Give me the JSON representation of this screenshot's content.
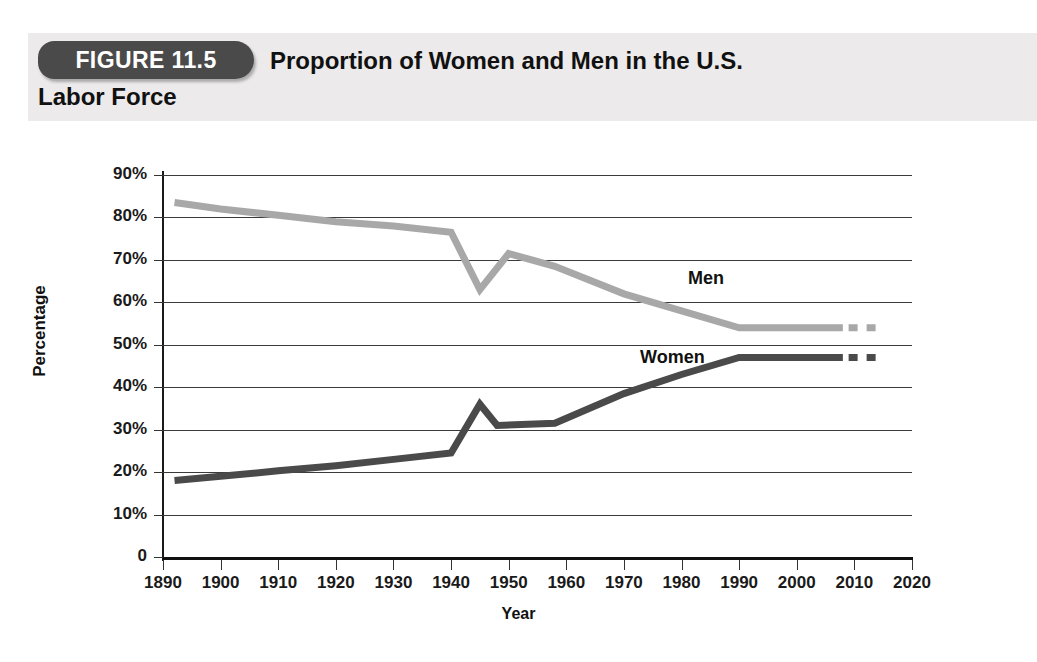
{
  "figure": {
    "badge": "FIGURE 11.5",
    "title_line1": "Proportion of Women and Men in the U.S.",
    "title_line2": "Labor Force"
  },
  "colors": {
    "men_line": "#a8a8a8",
    "women_line": "#4a4a4a",
    "badge_bg": "#4b4a4a",
    "header_bg": "#eceaea",
    "grid": "#3a3a3a",
    "axis": "#111111"
  },
  "chart_data": {
    "type": "line",
    "xlabel": "Year",
    "ylabel": "Percentage",
    "xlim": [
      1890,
      2020
    ],
    "ylim": [
      0,
      90
    ],
    "grid": true,
    "legend": "inline-labels",
    "xticks": [
      1890,
      1900,
      1910,
      1920,
      1930,
      1940,
      1950,
      1960,
      1970,
      1980,
      1990,
      2000,
      2010,
      2020
    ],
    "xtick_labels": [
      "1890",
      "1900",
      "1910",
      "1920",
      "1930",
      "1940",
      "1950",
      "1960",
      "1970",
      "1980",
      "1990",
      "2000",
      "2010",
      "2020"
    ],
    "yticks": [
      0,
      10,
      20,
      30,
      40,
      50,
      60,
      70,
      80,
      90
    ],
    "ytick_labels": [
      "0",
      "10%",
      "20%",
      "30%",
      "40%",
      "50%",
      "60%",
      "70%",
      "80%",
      "90%"
    ],
    "series": [
      {
        "name": "Men",
        "color": "#a8a8a8",
        "solid": {
          "x": [
            1892,
            1900,
            1910,
            1920,
            1930,
            1940,
            1945,
            1950,
            1958,
            1970,
            1980,
            1990,
            2000,
            2008
          ],
          "y": [
            83.5,
            82.0,
            80.5,
            79.0,
            78.0,
            76.5,
            63.0,
            71.5,
            68.5,
            62.0,
            58.0,
            54.0,
            54.0,
            54.0
          ]
        },
        "projected": {
          "x": [
            2009,
            2014
          ],
          "y": [
            54.0,
            54.0
          ],
          "style": "dashed"
        }
      },
      {
        "name": "Women",
        "color": "#4a4a4a",
        "solid": {
          "x": [
            1892,
            1900,
            1910,
            1920,
            1930,
            1940,
            1945,
            1948,
            1958,
            1970,
            1980,
            1990,
            2000,
            2008
          ],
          "y": [
            18.0,
            19.0,
            20.3,
            21.5,
            23.0,
            24.5,
            36.0,
            31.0,
            31.5,
            38.5,
            43.0,
            47.0,
            47.0,
            47.0
          ]
        },
        "projected": {
          "x": [
            2009,
            2014
          ],
          "y": [
            47.0,
            47.0
          ],
          "style": "dashed"
        }
      }
    ],
    "annotations": [
      {
        "text": "Men",
        "x": 1975,
        "y": 64.5
      },
      {
        "text": "Women",
        "x": 1965,
        "y": 50.5
      }
    ]
  }
}
